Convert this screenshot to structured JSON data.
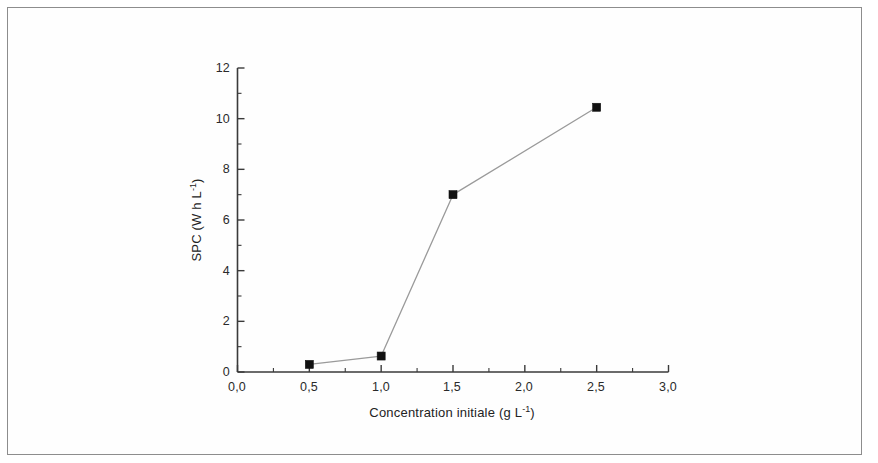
{
  "figure": {
    "background_color": "#ffffff",
    "frame_color": "#8d8d8d",
    "axis_color": "#3a3a3a",
    "line_color": "#9a9a9a",
    "marker_color": "#111111"
  },
  "chart_data": {
    "type": "line",
    "title": "",
    "subtitle": "",
    "xlabel": "Concentration initiale (g L⁻¹)",
    "ylabel": "SPC (W h L⁻¹)",
    "xlabel_parts": {
      "text": "Concentration initiale (g L",
      "exponent": "-1",
      "tail": ")"
    },
    "ylabel_parts": {
      "text": "SPC (W h L",
      "exponent": "-1",
      "tail": ")"
    },
    "xlim": [
      0.0,
      3.0
    ],
    "ylim": [
      0,
      12
    ],
    "grid": false,
    "legend": null,
    "legend_position": "none",
    "decimal_separator": ",",
    "x_tick_labels": [
      "0,0",
      "0,5",
      "1,0",
      "1,5",
      "2,0",
      "2,5",
      "3,0"
    ],
    "x_tick_values": [
      0.0,
      0.5,
      1.0,
      1.5,
      2.0,
      2.5,
      3.0
    ],
    "x_minor_step": 0.25,
    "y_tick_labels": [
      "0",
      "2",
      "4",
      "6",
      "8",
      "10",
      "12"
    ],
    "y_tick_values": [
      0,
      2,
      4,
      6,
      8,
      10,
      12
    ],
    "y_minor_step": 1,
    "marker": "filled-square",
    "series": [
      {
        "name": "SPC",
        "x": [
          0.5,
          1.0,
          1.5,
          2.5
        ],
        "values": [
          0.3,
          0.63,
          7.0,
          10.45
        ]
      }
    ],
    "points": [
      {
        "x": 0.5,
        "y": 0.3
      },
      {
        "x": 1.0,
        "y": 0.63
      },
      {
        "x": 1.5,
        "y": 7.0
      },
      {
        "x": 2.5,
        "y": 10.45
      }
    ]
  }
}
